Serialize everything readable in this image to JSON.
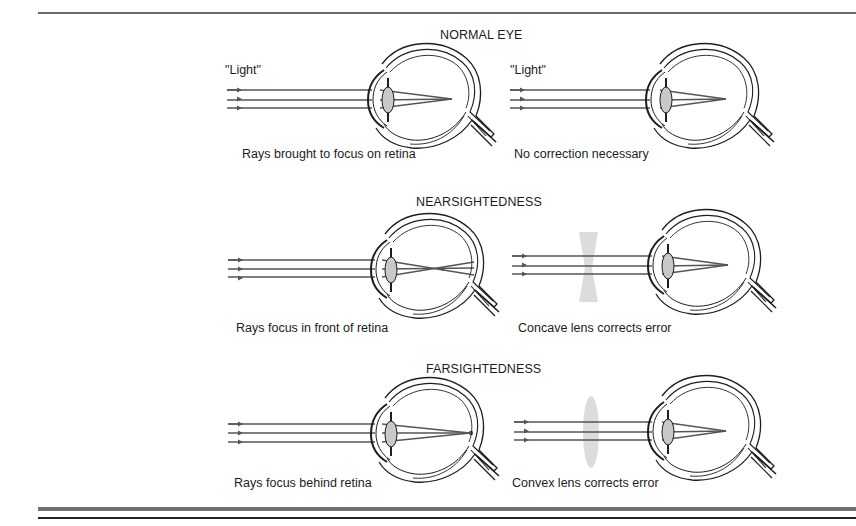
{
  "figure": {
    "sections": [
      {
        "id": "normal",
        "title": "NORMAL EYE",
        "left": {
          "light_label": "\"Light\"",
          "caption": "Rays brought to focus on retina",
          "focus": "on-retina",
          "corrective_lens": "none"
        },
        "right": {
          "light_label": "\"Light\"",
          "caption": "No correction necessary",
          "focus": "on-retina",
          "corrective_lens": "none"
        }
      },
      {
        "id": "nearsightedness",
        "title": "NEARSIGHTEDNESS",
        "left": {
          "caption": "Rays focus in front of retina",
          "focus": "in-front-of-retina",
          "corrective_lens": "none"
        },
        "right": {
          "caption": "Concave lens corrects error",
          "focus": "on-retina",
          "corrective_lens": "concave"
        }
      },
      {
        "id": "farsightedness",
        "title": "FARSIGHTEDNESS",
        "left": {
          "caption": "Rays focus behind retina",
          "focus": "behind-retina",
          "corrective_lens": "none"
        },
        "right": {
          "caption": "Convex lens corrects error",
          "focus": "on-retina",
          "corrective_lens": "convex"
        }
      }
    ],
    "colors": {
      "ray": "#555555",
      "outline": "#1e1e1e",
      "lens_fill": "#c8c8c8",
      "corrective_lens": "#cfcfcf",
      "rule": "#6a6a6a"
    }
  }
}
